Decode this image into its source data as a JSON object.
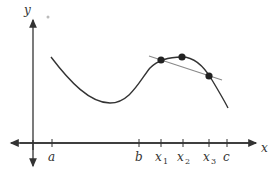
{
  "diagram": {
    "type": "function-graph",
    "axes": {
      "x_label": "x",
      "y_label": "y"
    },
    "x_ticks": [
      {
        "id": "a",
        "label": "a",
        "sub": "",
        "px": 52
      },
      {
        "id": "b",
        "label": "b",
        "sub": "",
        "px": 139
      },
      {
        "id": "x1",
        "label": "x",
        "sub": "1",
        "px": 161
      },
      {
        "id": "x2",
        "label": "x",
        "sub": "2",
        "px": 183
      },
      {
        "id": "x3",
        "label": "x",
        "sub": "3",
        "px": 209
      },
      {
        "id": "c",
        "label": "c",
        "sub": "",
        "px": 227
      }
    ],
    "points": [
      {
        "id": "p1",
        "at": "x1",
        "px": 161,
        "py": 60
      },
      {
        "id": "p2",
        "at": "x2",
        "px": 182,
        "py": 57
      },
      {
        "id": "p3",
        "at": "x3",
        "px": 209,
        "py": 76
      }
    ],
    "secant_line": {
      "from": [
        149,
        56
      ],
      "to": [
        222,
        80
      ],
      "color": "#888888"
    },
    "curve_color": "#333333"
  }
}
